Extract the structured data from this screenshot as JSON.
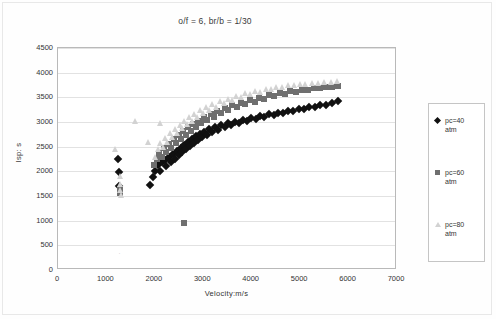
{
  "chart_data": {
    "type": "scatter",
    "title": "o/f = 6, br/b = 1/30",
    "xlabel": "Velocity:m/s",
    "ylabel": "Isp: s",
    "xlim": [
      0,
      7000
    ],
    "ylim": [
      0,
      4500
    ],
    "xticks": [
      0,
      1000,
      2000,
      3000,
      4000,
      5000,
      6000,
      7000
    ],
    "yticks": [
      0,
      500,
      1000,
      1500,
      2000,
      2500,
      3000,
      3500,
      4000,
      4500
    ],
    "grid": "horizontal",
    "legend_position": "right-outside",
    "series": [
      {
        "name": "pc=40\natm",
        "label": "pc=40 atm",
        "marker": "diamond",
        "color": "#111111",
        "points": [
          [
            1240,
            2250
          ],
          [
            1250,
            1980
          ],
          [
            1255,
            1700
          ],
          [
            1900,
            1720
          ],
          [
            1960,
            1880
          ],
          [
            2010,
            2010
          ],
          [
            2060,
            2120
          ],
          [
            2110,
            2010
          ],
          [
            2150,
            2180
          ],
          [
            2200,
            2230
          ],
          [
            2240,
            2110
          ],
          [
            2290,
            2290
          ],
          [
            2330,
            2180
          ],
          [
            2370,
            2350
          ],
          [
            2410,
            2260
          ],
          [
            2450,
            2420
          ],
          [
            2490,
            2330
          ],
          [
            2530,
            2480
          ],
          [
            2570,
            2400
          ],
          [
            2610,
            2540
          ],
          [
            2650,
            2460
          ],
          [
            2690,
            2600
          ],
          [
            2730,
            2520
          ],
          [
            2770,
            2660
          ],
          [
            2810,
            2580
          ],
          [
            2850,
            2710
          ],
          [
            2890,
            2640
          ],
          [
            2930,
            2760
          ],
          [
            2980,
            2690
          ],
          [
            3020,
            2800
          ],
          [
            3070,
            2740
          ],
          [
            3120,
            2850
          ],
          [
            3180,
            2790
          ],
          [
            3240,
            2890
          ],
          [
            3300,
            2840
          ],
          [
            3370,
            2930
          ],
          [
            3440,
            2890
          ],
          [
            3510,
            2970
          ],
          [
            3580,
            2930
          ],
          [
            3660,
            3010
          ],
          [
            3740,
            2980
          ],
          [
            3820,
            3050
          ],
          [
            3900,
            3020
          ],
          [
            3990,
            3090
          ],
          [
            4080,
            3060
          ],
          [
            4170,
            3120
          ],
          [
            4260,
            3100
          ],
          [
            4350,
            3160
          ],
          [
            4450,
            3140
          ],
          [
            4550,
            3190
          ],
          [
            4650,
            3180
          ],
          [
            4750,
            3230
          ],
          [
            4860,
            3220
          ],
          [
            4970,
            3260
          ],
          [
            5080,
            3260
          ],
          [
            5190,
            3300
          ],
          [
            5300,
            3300
          ],
          [
            5420,
            3340
          ],
          [
            5540,
            3350
          ],
          [
            5660,
            3390
          ],
          [
            5780,
            3430
          ]
        ]
      },
      {
        "name": "pc=60\natm",
        "label": "pc=60 atm",
        "marker": "square",
        "color": "#6f6f6f",
        "points": [
          [
            2600,
            950
          ],
          [
            1270,
            1640
          ],
          [
            1280,
            1560
          ],
          [
            1990,
            2120
          ],
          [
            2040,
            2260
          ],
          [
            2090,
            2380
          ],
          [
            2140,
            2290
          ],
          [
            2190,
            2470
          ],
          [
            2240,
            2390
          ],
          [
            2290,
            2560
          ],
          [
            2340,
            2480
          ],
          [
            2390,
            2650
          ],
          [
            2440,
            2570
          ],
          [
            2490,
            2730
          ],
          [
            2540,
            2660
          ],
          [
            2590,
            2810
          ],
          [
            2640,
            2740
          ],
          [
            2690,
            2890
          ],
          [
            2740,
            2820
          ],
          [
            2790,
            2960
          ],
          [
            2840,
            2900
          ],
          [
            2900,
            3030
          ],
          [
            2960,
            2970
          ],
          [
            3020,
            3100
          ],
          [
            3080,
            3040
          ],
          [
            3150,
            3160
          ],
          [
            3220,
            3110
          ],
          [
            3290,
            3220
          ],
          [
            3360,
            3180
          ],
          [
            3440,
            3280
          ],
          [
            3520,
            3240
          ],
          [
            3600,
            3340
          ],
          [
            3690,
            3300
          ],
          [
            3780,
            3390
          ],
          [
            3870,
            3360
          ],
          [
            3960,
            3440
          ],
          [
            4060,
            3410
          ],
          [
            4160,
            3490
          ],
          [
            4260,
            3470
          ],
          [
            4360,
            3540
          ],
          [
            4470,
            3520
          ],
          [
            4580,
            3580
          ],
          [
            4690,
            3570
          ],
          [
            4800,
            3620
          ],
          [
            4920,
            3610
          ],
          [
            5040,
            3650
          ],
          [
            5160,
            3650
          ],
          [
            5280,
            3680
          ],
          [
            5400,
            3680
          ],
          [
            5530,
            3700
          ],
          [
            5660,
            3710
          ],
          [
            5780,
            3720
          ]
        ]
      },
      {
        "name": "pc=80\natm",
        "label": "pc=80 atm",
        "marker": "triangle",
        "color": "#d2d2d2",
        "points": [
          [
            1270,
            1900
          ],
          [
            1285,
            1750
          ],
          [
            1290,
            1620
          ],
          [
            1300,
            1520
          ],
          [
            1180,
            2450
          ],
          [
            1600,
            3030
          ],
          [
            1850,
            2600
          ],
          [
            2100,
            2980
          ],
          [
            2010,
            2300
          ],
          [
            2060,
            2450
          ],
          [
            2110,
            2580
          ],
          [
            2160,
            2500
          ],
          [
            2210,
            2680
          ],
          [
            2260,
            2600
          ],
          [
            2310,
            2770
          ],
          [
            2360,
            2690
          ],
          [
            2410,
            2860
          ],
          [
            2460,
            2780
          ],
          [
            2510,
            2940
          ],
          [
            2560,
            2870
          ],
          [
            2610,
            3020
          ],
          [
            2660,
            2950
          ],
          [
            2710,
            3100
          ],
          [
            2760,
            3030
          ],
          [
            2810,
            3170
          ],
          [
            2870,
            3110
          ],
          [
            2930,
            3240
          ],
          [
            2990,
            3180
          ],
          [
            3050,
            3300
          ],
          [
            3120,
            3250
          ],
          [
            3190,
            3360
          ],
          [
            3260,
            3310
          ],
          [
            3340,
            3420
          ],
          [
            3420,
            3380
          ],
          [
            3500,
            3470
          ],
          [
            3590,
            3440
          ],
          [
            3680,
            3530
          ],
          [
            3770,
            3500
          ],
          [
            3870,
            3580
          ],
          [
            3970,
            3560
          ],
          [
            4070,
            3630
          ],
          [
            4180,
            3610
          ],
          [
            4290,
            3670
          ],
          [
            4400,
            3660
          ],
          [
            4510,
            3710
          ],
          [
            4630,
            3700
          ],
          [
            4750,
            3750
          ],
          [
            4870,
            3740
          ],
          [
            4990,
            3780
          ],
          [
            5110,
            3780
          ],
          [
            5240,
            3800
          ],
          [
            5370,
            3800
          ],
          [
            5500,
            3820
          ],
          [
            5630,
            3820
          ],
          [
            5760,
            3830
          ]
        ]
      }
    ],
    "annotations": [
      {
        "text": "·",
        "x": 1250,
        "y": 400
      }
    ]
  }
}
